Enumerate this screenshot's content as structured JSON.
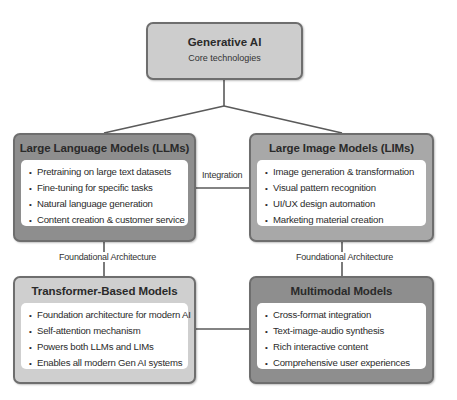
{
  "diagram": {
    "root": {
      "title": "Generative AI",
      "subtitle": "Core technologies"
    },
    "nodes": {
      "llm": {
        "title": "Large Language Models (LLMs)",
        "items": [
          "Pretraining on large text datasets",
          "Fine-tuning for specific tasks",
          "Natural language generation",
          "Content creation & customer service"
        ]
      },
      "lim": {
        "title": "Large Image Models (LIMs)",
        "items": [
          "Image generation & transformation",
          "Visual pattern recognition",
          "UI/UX design automation",
          "Marketing material creation"
        ]
      },
      "transformer": {
        "title": "Transformer-Based Models",
        "items": [
          "Foundation architecture for modern AI",
          "Self-attention mechanism",
          "Powers both LLMs and LIMs",
          "Enables all modern Gen AI systems"
        ]
      },
      "multimodal": {
        "title": "Multimodal Models",
        "items": [
          "Cross-format integration",
          "Text-image-audio synthesis",
          "Rich interactive content",
          "Comprehensive user experiences"
        ]
      }
    },
    "edges": {
      "integration_label": "Integration",
      "foundational_left_label": "Foundational Architecture",
      "foundational_right_label": "Foundational Architecture"
    },
    "colors": {
      "root_fill": "#cdcdcd",
      "llm_fill": "#8e8e8e",
      "lim_fill": "#a8a8a8",
      "transformer_fill": "#cfcfcf",
      "multimodal_fill": "#8e8e8e",
      "border": "#6e6e6e",
      "connector": "#5a5a5a"
    }
  }
}
